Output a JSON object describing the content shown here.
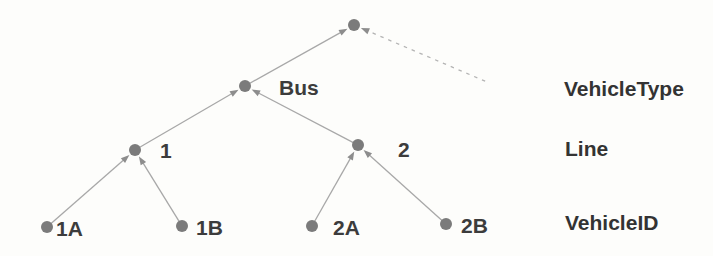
{
  "diagram": {
    "type": "tree",
    "nodes": [
      {
        "id": "root",
        "label": "",
        "x": 354,
        "y": 25
      },
      {
        "id": "bus",
        "label": "Bus",
        "x": 245,
        "y": 86,
        "lx": 279,
        "ly": 95
      },
      {
        "id": "line-1",
        "label": "1",
        "x": 135,
        "y": 150,
        "lx": 160,
        "ly": 158
      },
      {
        "id": "line-2",
        "label": "2",
        "x": 358,
        "y": 145,
        "lx": 398,
        "ly": 157
      },
      {
        "id": "vehicle-1A",
        "label": "1A",
        "x": 47,
        "y": 227,
        "lx": 56,
        "ly": 236
      },
      {
        "id": "vehicle-1B",
        "label": "1B",
        "x": 182,
        "y": 226,
        "lx": 196,
        "ly": 235
      },
      {
        "id": "vehicle-2A",
        "label": "2A",
        "x": 312,
        "y": 226,
        "lx": 333,
        "ly": 235
      },
      {
        "id": "vehicle-2B",
        "label": "2B",
        "x": 446,
        "y": 224,
        "lx": 461,
        "ly": 233
      },
      {
        "id": "dashed-origin",
        "label": "",
        "x": 487,
        "y": 82,
        "hidden": true
      }
    ],
    "edges": [
      {
        "from": "bus",
        "to": "root",
        "style": "solid"
      },
      {
        "from": "dashed-origin",
        "to": "root",
        "style": "dashed"
      },
      {
        "from": "line-1",
        "to": "bus",
        "style": "solid"
      },
      {
        "from": "line-2",
        "to": "bus",
        "style": "solid"
      },
      {
        "from": "vehicle-1A",
        "to": "line-1",
        "style": "solid"
      },
      {
        "from": "vehicle-1B",
        "to": "line-1",
        "style": "solid"
      },
      {
        "from": "vehicle-2A",
        "to": "line-2",
        "style": "solid"
      },
      {
        "from": "vehicle-2B",
        "to": "line-2",
        "style": "solid"
      }
    ],
    "level_labels": [
      {
        "text": "VehicleType"
      },
      {
        "text": "Line"
      },
      {
        "text": "VehicleID"
      }
    ],
    "colors": {
      "background": "#fdfdfb",
      "node": "#7b7b7b",
      "edge": "#a8a8a8",
      "edge_dashed": "#b4b4b4",
      "arrow": "#8d8d8d",
      "node_label": "#3c3c3c",
      "level_label": "#333333"
    }
  }
}
